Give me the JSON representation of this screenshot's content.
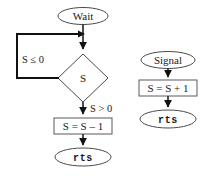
{
  "figure": {
    "background_color": "#ffffff",
    "line_color": "#111111",
    "shape_border_color": "#4a4a4a",
    "text_color": "#1a1a1a"
  },
  "wait_flow": {
    "start_label": "Wait",
    "decision_label": "S",
    "branch_false_label": "S ≤ 0",
    "branch_true_label": "S > 0",
    "process_label": "S = S – 1",
    "end_label": "rts"
  },
  "signal_flow": {
    "start_label": "Signal",
    "process_label": "S = S + 1",
    "end_label": "rts"
  }
}
